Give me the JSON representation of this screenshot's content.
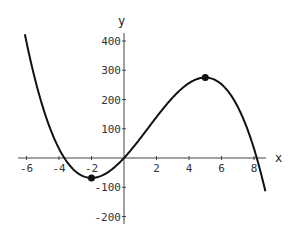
{
  "chart_data": {
    "type": "line",
    "title": "",
    "xlabel": "x",
    "ylabel": "y",
    "xlim": [
      -6.1,
      8.7
    ],
    "ylim": [
      -220,
      420
    ],
    "grid": false,
    "x_ticks": [
      -6,
      -4,
      -2,
      2,
      4,
      6,
      8
    ],
    "x_tick_labels": [
      "-6",
      "-4",
      "-2",
      "2",
      "4",
      "6",
      "8"
    ],
    "y_ticks": [
      400,
      300,
      200,
      100,
      -100,
      -200
    ],
    "y_tick_labels": [
      "400",
      "300",
      "200",
      "100",
      "-100",
      "-200"
    ],
    "series": [
      {
        "name": "cubic curve",
        "description": "y = -2x^3 + 9x^2 + 60x (approx.)",
        "x": [
          -6,
          -5,
          -4,
          -3,
          -2,
          -1,
          0,
          1,
          2,
          3,
          4,
          5,
          6,
          7,
          8,
          8.7
        ],
        "y": [
          396,
          175,
          48,
          -21,
          -68,
          -49,
          0,
          67,
          140,
          207,
          256,
          275,
          252,
          175,
          32,
          -114
        ]
      }
    ],
    "marked_points": [
      {
        "label": "local minimum",
        "x": -2,
        "y": -68
      },
      {
        "label": "local maximum",
        "x": 5,
        "y": 275
      }
    ],
    "colors": {
      "curve": "#111111",
      "axes": "#444444",
      "points": "#111111"
    }
  }
}
